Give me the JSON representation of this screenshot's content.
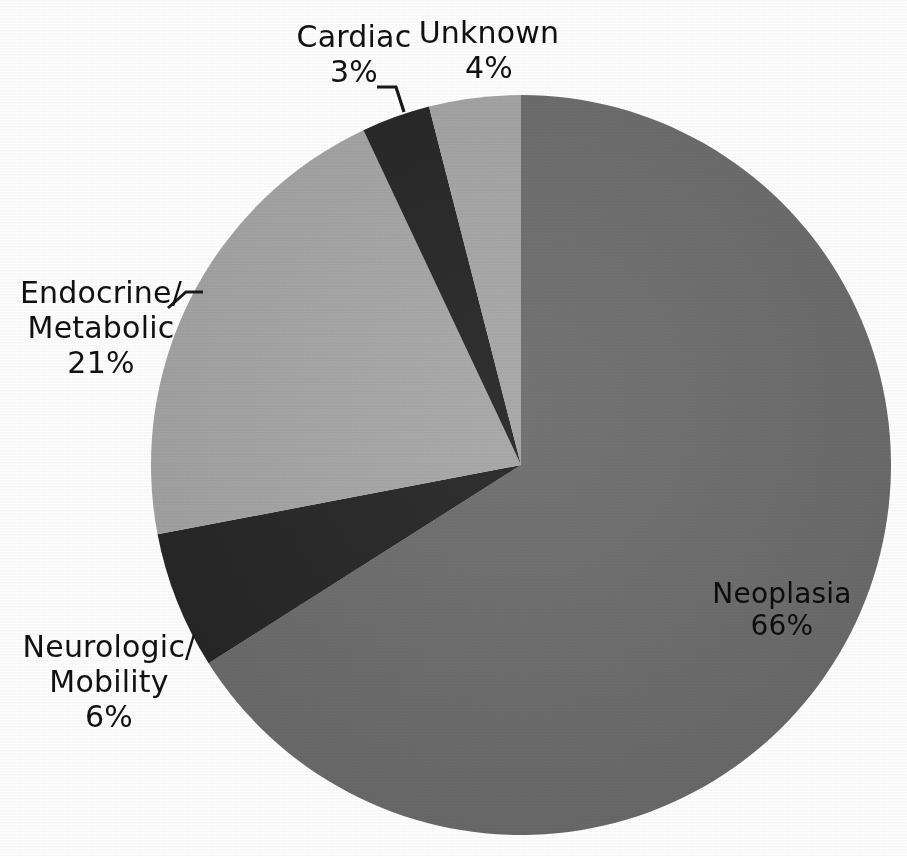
{
  "chart_data": {
    "type": "pie",
    "title": "",
    "subtitle": "",
    "xlabel": "",
    "ylabel": "",
    "legend_position": "none",
    "grid": false,
    "units": "percent",
    "start_angle_deg": 0,
    "direction": "clockwise",
    "center": {
      "x": 521,
      "y": 465
    },
    "radius": 370,
    "categories": [
      "Neoplasia",
      "Neurologic/ Mobility",
      "Endocrine/ Metabolic",
      "Cardiac",
      "Unknown"
    ],
    "values": [
      66,
      6,
      21,
      3,
      4
    ],
    "slices": [
      {
        "name": "neoplasia",
        "label": "Neoplasia",
        "value_text": "66%",
        "value": 66,
        "color": "#6e6e6e",
        "start_deg": 0,
        "end_deg": 237.6,
        "label_placement": "inside"
      },
      {
        "name": "neurologic-mobility",
        "label_line1": "Neurologic/",
        "label_line2": "Mobility",
        "value_text": "6%",
        "value": 6,
        "color": "#262626",
        "start_deg": 237.6,
        "end_deg": 259.2,
        "label_placement": "outside-left"
      },
      {
        "name": "endocrine-metabolic",
        "label_line1": "Endocrine/",
        "label_line2": "Metabolic",
        "value_text": "21%",
        "value": 21,
        "color": "#a8a8a8",
        "start_deg": 259.2,
        "end_deg": 334.8,
        "label_placement": "outside-left",
        "has_leader_line": true
      },
      {
        "name": "cardiac",
        "label": "Cardiac",
        "value_text": "3%",
        "value": 3,
        "color": "#262626",
        "start_deg": 334.8,
        "end_deg": 345.6,
        "label_placement": "outside-top",
        "has_leader_line": true
      },
      {
        "name": "unknown",
        "label": "Unknown",
        "value_text": "4%",
        "value": 4,
        "color": "#a8a8a8",
        "start_deg": 345.6,
        "end_deg": 360,
        "label_placement": "outside-top"
      }
    ],
    "colors": {
      "neoplasia": "#6e6e6e",
      "dark_slice": "#262626",
      "light_slice": "#a8a8a8",
      "background": "#ffffff",
      "text": "#111111",
      "leader_line": "#1a1a1a"
    }
  },
  "labels": {
    "cardiac": {
      "name": "Cardiac",
      "pct": "3%"
    },
    "unknown": {
      "name": "Unknown",
      "pct": "4%"
    },
    "endocrine": {
      "line1": "Endocrine/",
      "line2": "Metabolic",
      "pct": "21%"
    },
    "neurologic": {
      "line1": "Neurologic/",
      "line2": "Mobility",
      "pct": "6%"
    },
    "neoplasia": {
      "name": "Neoplasia",
      "pct": "66%"
    }
  }
}
